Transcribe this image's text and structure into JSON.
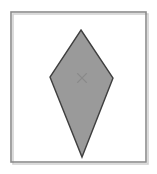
{
  "figure": {
    "title": "",
    "canvas": {
      "width": 157,
      "height": 174,
      "background": "#ffffff"
    },
    "frame": {
      "name": "outer-border",
      "x": 11,
      "y": 12,
      "width": 135,
      "height": 150,
      "stroke": "#8c8c8c",
      "stroke_width": 1.6,
      "fill": "none",
      "shadow": "#cfcfcf"
    },
    "shape": {
      "name": "kite-polygon",
      "kind": "kite",
      "fill": "#9a9a9a",
      "stroke": "#3f3f3f",
      "stroke_width": 1.4,
      "points": "81,30 113,78 82,157 50,77",
      "vertices": [
        {
          "label": "top",
          "x": 81,
          "y": 30
        },
        {
          "label": "right",
          "x": 113,
          "y": 78
        },
        {
          "label": "bottom",
          "x": 82,
          "y": 157
        },
        {
          "label": "left",
          "x": 50,
          "y": 77
        }
      ]
    },
    "center_mark": {
      "name": "center-cross",
      "glyph": "x",
      "x": 82,
      "y": 78,
      "size": 9,
      "stroke": "#8a8a8a",
      "stroke_width": 1.1
    }
  }
}
